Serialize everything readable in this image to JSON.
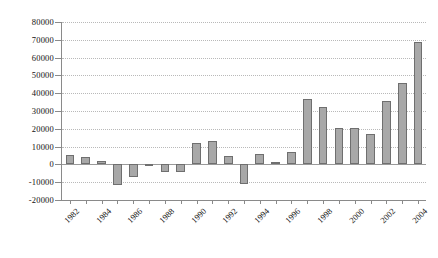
{
  "chart_data": {
    "type": "bar",
    "title": "",
    "subtitle": "",
    "xlabel": "",
    "ylabel": "",
    "ylim": [
      -20000,
      80000
    ],
    "ytick_step": 10000,
    "grid": true,
    "grid_style": "dotted-horizontal",
    "legend": "none",
    "bar_fill_color": "#a8a8a8",
    "bar_border_color": "#6f6f6f",
    "background_color": "#ffffff",
    "axis_color": "#8a8a8a",
    "ytick_labels": [
      "80000",
      "70000",
      "60000",
      "50000",
      "40000",
      "30000",
      "20000",
      "10000",
      "0",
      "-10000",
      "-20000"
    ],
    "ytick_values": [
      80000,
      70000,
      60000,
      50000,
      40000,
      30000,
      20000,
      10000,
      0,
      -10000,
      -20000
    ],
    "xtick_labels": [
      "1982",
      "1984",
      "1986",
      "1988",
      "1990",
      "1992",
      "1994",
      "1996",
      "1998",
      "2000",
      "2002",
      "2004"
    ],
    "xtick_label_rotation": -45,
    "categories": [
      "1982",
      "1983",
      "1984",
      "1985",
      "1986",
      "1987",
      "1988",
      "1989",
      "1990",
      "1991",
      "1992",
      "1993",
      "1994",
      "1995",
      "1996",
      "1997",
      "1998",
      "1999",
      "2000",
      "2001",
      "2002",
      "2003",
      "2004"
    ],
    "values": [
      5200,
      4100,
      1900,
      -11500,
      -7000,
      400,
      -4300,
      -4200,
      12000,
      13200,
      4500,
      -11000,
      6000,
      1400,
      6800,
      37000,
      32000,
      20500,
      20400,
      16800,
      35500,
      46000,
      68500
    ]
  }
}
